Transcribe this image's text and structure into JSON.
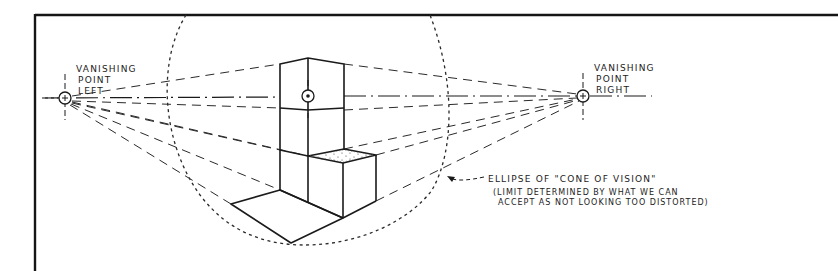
{
  "diagram": {
    "type": "two-point perspective sketch",
    "labels": {
      "vp_left": [
        "VANISHING",
        "POINT",
        "LEFT"
      ],
      "vp_right": [
        "VANISHING",
        "POINT",
        "RIGHT"
      ],
      "ellipse_title": "ELLIPSE OF \"CONE OF VISION\"",
      "ellipse_note_line1": "(LIMIT DETERMINED BY WHAT WE CAN",
      "ellipse_note_line2": "ACCEPT AS NOT LOOKING TOO DISTORTED)"
    },
    "elements": [
      {
        "name": "vanishing-point-left",
        "x": 65,
        "y": 98
      },
      {
        "name": "vanishing-point-right",
        "x": 583,
        "y": 96
      },
      {
        "name": "horizon-line",
        "style": "dash-dot"
      },
      {
        "name": "center-of-vision",
        "x": 308,
        "y": 96
      },
      {
        "name": "cone-of-vision-ellipse",
        "style": "dotted"
      },
      {
        "name": "stacked-boxes",
        "style": "solid"
      },
      {
        "name": "floor-plane",
        "style": "solid"
      },
      {
        "name": "convergence-lines",
        "style": "dashed"
      }
    ],
    "colors": {
      "ink": "#1a1a1a",
      "paper": "#ffffff"
    }
  }
}
